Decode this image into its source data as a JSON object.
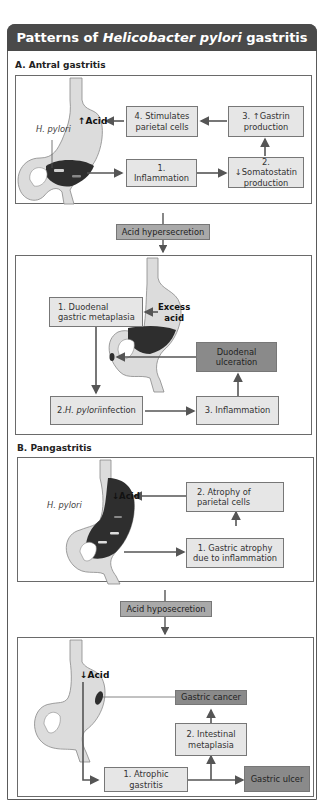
{
  "title": {
    "prefix": "Patterns of ",
    "italic": "Helicobacter pylori",
    "suffix": " gastritis"
  },
  "section_a": {
    "label": "A. Antral gastritis",
    "top_panel": {
      "organism_label": "H. pylori",
      "acid_label": "↑Acid",
      "boxes": [
        {
          "id": "inflammation",
          "text": "1. Inflammation"
        },
        {
          "id": "somatostatin",
          "text": "2. ↓Somatostatin production"
        },
        {
          "id": "gastrin",
          "text": "3. ↑Gastrin production"
        },
        {
          "id": "parietal",
          "text": "4. Stimulates parietal cells"
        }
      ]
    },
    "connector": "Acid hypersecretion",
    "bottom_panel": {
      "acid_label_line1": "Excess",
      "acid_label_line2": "acid",
      "boxes": [
        {
          "id": "metaplasia",
          "text": "1. Duodenal gastric metaplasia"
        },
        {
          "id": "infection_prefix",
          "text": "2. "
        },
        {
          "id": "infection_italic",
          "text": "H. pylori"
        },
        {
          "id": "infection_suffix",
          "text": " infection"
        },
        {
          "id": "inflammation",
          "text": "3. Inflammation"
        },
        {
          "id": "ulceration",
          "text": "Duodenal ulceration"
        }
      ]
    }
  },
  "section_b": {
    "label": "B. Pangastritis",
    "top_panel": {
      "organism_label": "H. pylori",
      "acid_label": "↓Acid",
      "boxes": [
        {
          "id": "atrophy_inflammation",
          "text": "1. Gastric atrophy due to inflammation"
        },
        {
          "id": "parietal_atrophy",
          "text": "2. Atrophy of parietal cells"
        }
      ]
    },
    "connector": "Acid hyposecretion",
    "bottom_panel": {
      "acid_label": "↓Acid",
      "boxes": [
        {
          "id": "atrophic",
          "text": "1. Atrophic gastritis"
        },
        {
          "id": "intestinal",
          "text": "2. Intestinal metaplasia"
        },
        {
          "id": "cancer",
          "text": "Gastric cancer"
        },
        {
          "id": "ulcer",
          "text": "Gastric ulcer"
        }
      ]
    }
  },
  "colors": {
    "title_bar": "#4a4a4a",
    "box_light": "#e6e6e6",
    "box_dark": "#8a8a8a",
    "box_mid": "#a9a9a9",
    "stomach_light": "#dcdcdc",
    "stomach_dark": "#2e2e2e",
    "arrow": "#555555"
  }
}
